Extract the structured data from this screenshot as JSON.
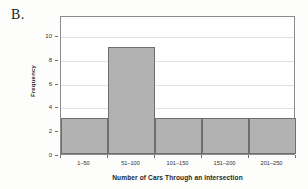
{
  "panel": {
    "letter": "B."
  },
  "chart_data": {
    "type": "bar",
    "title": "",
    "xlabel": "Number of Cars Through an Intersection",
    "ylabel": "Frequency",
    "categories": [
      "1–50",
      "51–100",
      "101–150",
      "151–200",
      "201–250"
    ],
    "values": [
      3,
      9,
      3,
      3,
      3
    ],
    "ylim": [
      0,
      11.7
    ],
    "yticks": [
      0,
      2,
      4,
      6,
      8,
      10
    ],
    "ytick_labels": [
      "0",
      "2",
      "4",
      "6",
      "8",
      "10"
    ],
    "grid": true,
    "legend": "none",
    "bar_fill_color": "#b2b2b2",
    "bar_edge_color": "#6e6e6e",
    "gridline_color": "#e2e2e2",
    "frame_color": "#8b8b8b"
  }
}
